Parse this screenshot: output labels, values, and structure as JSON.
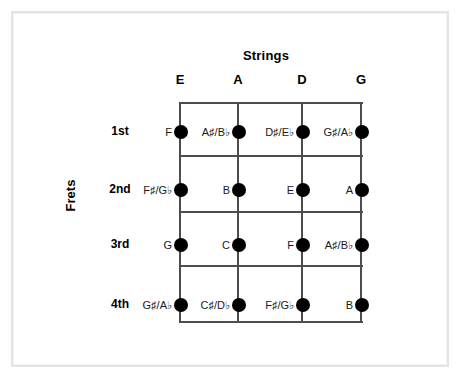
{
  "diagram": {
    "strings_axis_title": "Strings",
    "frets_axis_title": "Frets",
    "string_headers": [
      "E",
      "A",
      "D",
      "G"
    ],
    "fret_labels": [
      "1st",
      "2nd",
      "3rd",
      "4th"
    ],
    "grid": {
      "columns": 4,
      "rows": 4,
      "line_color": "#4d4d4d",
      "dot_color": "#000000",
      "border_color": "#e3e3e3",
      "background": "#ffffff"
    },
    "notes": [
      {
        "fret": "1st",
        "cells": [
          {
            "string": "E",
            "label": "F"
          },
          {
            "string": "A",
            "label": "A♯/B♭"
          },
          {
            "string": "D",
            "label": "D♯/E♭"
          },
          {
            "string": "G",
            "label": "G♯/A♭"
          }
        ]
      },
      {
        "fret": "2nd",
        "cells": [
          {
            "string": "E",
            "label": "F♯/G♭"
          },
          {
            "string": "A",
            "label": "B"
          },
          {
            "string": "D",
            "label": "E"
          },
          {
            "string": "G",
            "label": "A"
          }
        ]
      },
      {
        "fret": "3rd",
        "cells": [
          {
            "string": "E",
            "label": "G"
          },
          {
            "string": "A",
            "label": "C"
          },
          {
            "string": "D",
            "label": "F"
          },
          {
            "string": "G",
            "label": "A♯/B♭"
          }
        ]
      },
      {
        "fret": "4th",
        "cells": [
          {
            "string": "E",
            "label": "G♯/A♭"
          },
          {
            "string": "A",
            "label": "C♯/D♭"
          },
          {
            "string": "D",
            "label": "F♯/G♭"
          },
          {
            "string": "G",
            "label": "B"
          }
        ]
      }
    ]
  }
}
